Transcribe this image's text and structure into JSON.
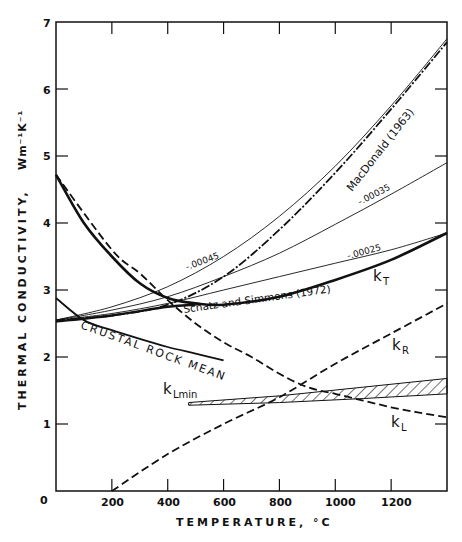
{
  "chart_data": {
    "type": "line",
    "title": "",
    "xlabel": "TEMPERATURE, °C",
    "ylabel": "THERMAL CONDUCTIVITY,",
    "yunits": "Wm⁻¹K⁻¹",
    "xlim": [
      0,
      1400
    ],
    "ylim": [
      0,
      7
    ],
    "xticks": [
      0,
      200,
      400,
      600,
      800,
      1000,
      1200
    ],
    "yticks": [
      0,
      1,
      2,
      3,
      4,
      5,
      6,
      7
    ],
    "grid": false,
    "legend": "inline labels",
    "series": [
      {
        "name": "MacDonald (1963)",
        "style": "dash-dot",
        "x": [
          0,
          200,
          400,
          600,
          800,
          1000,
          1200,
          1400
        ],
        "y": [
          2.55,
          2.62,
          2.78,
          3.2,
          3.9,
          4.75,
          5.7,
          6.7
        ]
      },
      {
        "name": "-.00045",
        "style": "thin",
        "x": [
          0,
          200,
          400,
          600,
          800,
          1000,
          1200,
          1400
        ],
        "y": [
          2.55,
          2.75,
          3.05,
          3.5,
          4.1,
          4.85,
          5.75,
          6.75
        ]
      },
      {
        "name": "-.00035",
        "style": "thin",
        "x": [
          0,
          200,
          400,
          600,
          800,
          1000,
          1200,
          1400
        ],
        "y": [
          2.55,
          2.7,
          2.9,
          3.2,
          3.55,
          3.98,
          4.43,
          4.9
        ]
      },
      {
        "name": "-.00025",
        "style": "thin",
        "x": [
          0,
          200,
          400,
          600,
          800,
          1000,
          1200,
          1400
        ],
        "y": [
          2.55,
          2.65,
          2.8,
          3.0,
          3.2,
          3.4,
          3.6,
          3.85
        ]
      },
      {
        "name": "kT (Schatz and Simmons (1972))",
        "style": "thick",
        "x": [
          0,
          100,
          200,
          300,
          400,
          500,
          600,
          800,
          1000,
          1200,
          1400
        ],
        "y": [
          4.72,
          4.0,
          3.5,
          3.1,
          2.88,
          2.8,
          2.78,
          2.9,
          3.15,
          3.45,
          3.85
        ]
      },
      {
        "name": "Crustal rock mean",
        "style": "solid",
        "x": [
          0,
          100,
          200,
          300,
          400,
          500,
          600
        ],
        "y": [
          2.88,
          2.55,
          2.4,
          2.27,
          2.15,
          2.05,
          1.95
        ]
      },
      {
        "name": "kL",
        "style": "dashed",
        "x": [
          0,
          200,
          300,
          400,
          500,
          600,
          700,
          800,
          900,
          1000,
          1100,
          1200,
          1300,
          1400
        ],
        "y": [
          4.72,
          3.6,
          3.25,
          2.85,
          2.5,
          2.22,
          2.0,
          1.75,
          1.55,
          1.45,
          1.35,
          1.25,
          1.17,
          1.1
        ]
      },
      {
        "name": "kR",
        "style": "dashed",
        "x": [
          200,
          400,
          600,
          800,
          1000,
          1200,
          1400
        ],
        "y": [
          0,
          0.55,
          1.0,
          1.4,
          1.9,
          2.35,
          2.8
        ]
      },
      {
        "name": "kLmin",
        "style": "hatched band",
        "x": [
          475,
          800,
          1100,
          1400
        ],
        "y_lower": [
          1.28,
          1.32,
          1.38,
          1.45
        ],
        "y_upper": [
          1.32,
          1.42,
          1.55,
          1.68
        ]
      }
    ],
    "annotations": [
      "MacDonald (1963)",
      "-.00045",
      "-.00035",
      "-.00025",
      "kT",
      "Schatz and Simmons (1972)",
      "CRUSTAL ROCK MEAN",
      "kR",
      "kL",
      "kLmin"
    ]
  },
  "labels": {
    "macdonald": "MacDonald (1963)",
    "c45": "-.00045",
    "c35": "-.00035",
    "c25": "-.00025",
    "schatz": "Schatz and Simmons (1972)",
    "crustal": "CRUSTAL ROCK MEAN",
    "kT_main": "k",
    "kT_sub": "T",
    "kR_main": "k",
    "kR_sub": "R",
    "kL_main": "k",
    "kL_sub": "L",
    "kLmin_main": "k",
    "kLmin_sub": "Lmin"
  },
  "axes": {
    "x_ticks": [
      "0",
      "200",
      "400",
      "600",
      "800",
      "1000",
      "1200"
    ],
    "y_ticks": [
      "0",
      "1",
      "2",
      "3",
      "4",
      "5",
      "6",
      "7"
    ],
    "x_title": "TEMPERATURE, °C",
    "y_title": "THERMAL CONDUCTIVITY,",
    "y_units": "Wm⁻¹K⁻¹"
  }
}
